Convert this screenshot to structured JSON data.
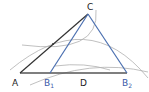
{
  "diagram": {
    "type": "geometric-construction",
    "points": {
      "A": {
        "label": "A",
        "x": 20,
        "y": 73
      },
      "B1": {
        "label": "B",
        "sub": "1",
        "x": 50,
        "y": 73
      },
      "D": {
        "label": "D",
        "x": 84,
        "y": 73
      },
      "B2": {
        "label": "B",
        "sub": "2",
        "x": 127,
        "y": 73
      },
      "C": {
        "label": "C",
        "x": 88,
        "y": 14
      }
    },
    "colors": {
      "line": "#333333",
      "blue_line": "#4a6fb0",
      "arc": "#aaaaaa",
      "blue_label": "#3a5aa8"
    }
  }
}
